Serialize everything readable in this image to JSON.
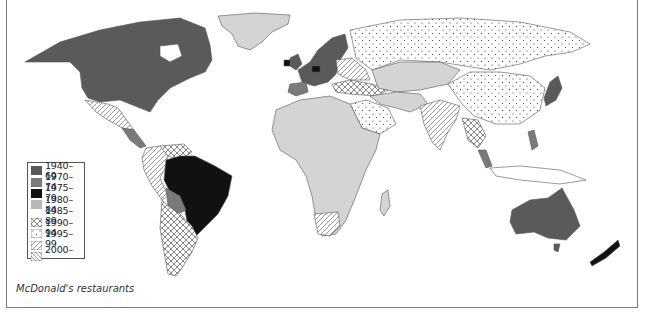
{
  "map": {
    "title": "",
    "caption": "McDonald's restaurants",
    "legend": {
      "items": [
        {
          "label": "1940–69",
          "pattern": "solid-dark",
          "color": "#5a5a5a"
        },
        {
          "label": "1970–74",
          "pattern": "solid-mid",
          "color": "#7a7a7a"
        },
        {
          "label": "1975–79",
          "pattern": "solid-black",
          "color": "#111111"
        },
        {
          "label": "1980–84",
          "pattern": "solid-light",
          "color": "#b8b8b8"
        },
        {
          "label": "1985–89",
          "pattern": "crosshatch",
          "color": "#555555"
        },
        {
          "label": "1990–94",
          "pattern": "dots",
          "color": "#333333"
        },
        {
          "label": "1995–99",
          "pattern": "diagonal-forward",
          "color": "#555555"
        },
        {
          "label": "2000–",
          "pattern": "diagonal-back",
          "color": "#555555"
        }
      ]
    },
    "regions": [
      {
        "name": "North America (USA, Canada)",
        "period": "1940–69"
      },
      {
        "name": "Greenland",
        "period": "1980–84"
      },
      {
        "name": "Mexico",
        "period": "1995–99"
      },
      {
        "name": "Central America",
        "period": "1970–74"
      },
      {
        "name": "Brazil",
        "period": "1975–79"
      },
      {
        "name": "Bolivia/Paraguay",
        "period": "1970–74"
      },
      {
        "name": "Argentina/Chile",
        "period": "1985–89"
      },
      {
        "name": "Colombia/Peru/Ecuador",
        "period": "1995–99"
      },
      {
        "name": "Venezuela",
        "period": "1985–89"
      },
      {
        "name": "Western Europe (UK, France, Germany, Scandinavia)",
        "period": "1940–69"
      },
      {
        "name": "Ireland, Netherlands",
        "period": "1975–79"
      },
      {
        "name": "Iberia",
        "period": "1970–74"
      },
      {
        "name": "Eastern Europe",
        "period": "1995–99"
      },
      {
        "name": "Balkans/Turkey",
        "period": "1985–89"
      },
      {
        "name": "Russia, China, Arabia",
        "period": "1990–94"
      },
      {
        "name": "Africa, Central Asia, Middle East",
        "period": "1980–84"
      },
      {
        "name": "India",
        "period": "1995–99"
      },
      {
        "name": "South Africa",
        "period": "1995–99"
      },
      {
        "name": "Japan",
        "period": "1940–69"
      },
      {
        "name": "Philippines, Malaysia",
        "period": "1970–74"
      },
      {
        "name": "Southeast Asia mainland",
        "period": "1985–89"
      },
      {
        "name": "Australia",
        "period": "1940–69"
      },
      {
        "name": "New Zealand",
        "period": "1975–79"
      }
    ]
  }
}
